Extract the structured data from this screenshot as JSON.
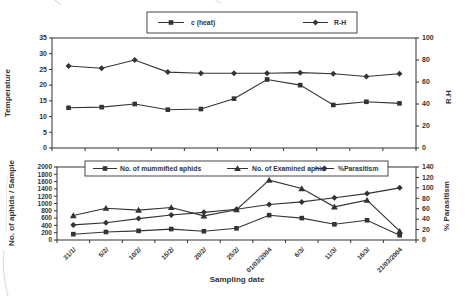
{
  "figure": {
    "ink": "#333333",
    "background": "#ffffff",
    "xlabel": "Sampling date"
  },
  "chart_data": [
    {
      "type": "line",
      "id": "temperature-humidity",
      "categories": [
        "31/1/",
        "5/2/",
        "10/2/",
        "15/2/",
        "20/2/",
        "25/2/",
        "01/03/2004",
        "6/3/",
        "11/3/",
        "16/3/",
        "21/03/2004"
      ],
      "x_tick_labels_visible": false,
      "legend_position": "top-outside",
      "axes": {
        "left": {
          "label": "Temperature",
          "min": 0,
          "max": 35,
          "ticks": [
            0,
            5,
            10,
            15,
            20,
            25,
            30,
            35
          ]
        },
        "right": {
          "label": "R.H",
          "min": 0,
          "max": 100,
          "ticks": [
            0,
            20,
            40,
            60,
            80,
            100
          ]
        }
      },
      "series": [
        {
          "name": "c (heat)",
          "marker": "square",
          "axis": "left",
          "values": [
            12.8,
            13,
            14,
            12.2,
            12.4,
            15.7,
            21.8,
            20,
            13.7,
            14.7,
            14.2
          ]
        },
        {
          "name": "R-H",
          "marker": "diamond",
          "axis": "right",
          "values": [
            74.5,
            72.5,
            80,
            69,
            68,
            68,
            68,
            68.5,
            67.5,
            65,
            67.5
          ]
        }
      ]
    },
    {
      "type": "line",
      "id": "aphids-parasitism",
      "categories": [
        "31/1/",
        "5/2/",
        "10/2/",
        "15/2/",
        "20/2/",
        "25/2/",
        "01/03/2004",
        "6/3/",
        "11/3/",
        "16/3/",
        "21/03/2004"
      ],
      "x_tick_labels_visible": true,
      "xlabel": "Sampling date",
      "legend_position": "top-inside",
      "axes": {
        "left": {
          "label": "No. of aphids / Sample",
          "min": 0,
          "max": 2000,
          "ticks": [
            0,
            200,
            400,
            600,
            800,
            1000,
            1200,
            1400,
            1600,
            1800,
            2000
          ]
        },
        "right": {
          "label": "% Parasitism",
          "min": 0,
          "max": 140,
          "ticks": [
            0,
            20,
            40,
            60,
            80,
            100,
            120,
            140
          ]
        }
      },
      "series": [
        {
          "name": "No. of mummified aphids",
          "marker": "square",
          "axis": "left",
          "values": [
            160,
            220,
            250,
            300,
            240,
            320,
            680,
            600,
            430,
            540,
            130
          ]
        },
        {
          "name": "No. of Examined aphid",
          "marker": "triangle",
          "axis": "left",
          "values": [
            670,
            870,
            820,
            890,
            660,
            830,
            1640,
            1410,
            910,
            1090,
            240
          ]
        },
        {
          "name": "%Parasitism",
          "marker": "diamond",
          "axis": "right",
          "values": [
            29,
            33,
            41,
            48,
            53,
            59,
            68,
            73,
            81,
            89,
            100
          ]
        }
      ]
    }
  ]
}
